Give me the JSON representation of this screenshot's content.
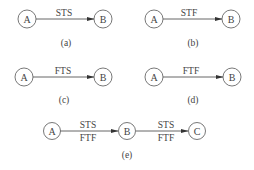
{
  "panels": [
    {
      "id": "a",
      "caption": "(a)",
      "from": "A",
      "to": "B",
      "labels": [
        "STS"
      ]
    },
    {
      "id": "b",
      "caption": "(b)",
      "from": "A",
      "to": "B",
      "labels": [
        "STF"
      ]
    },
    {
      "id": "c",
      "caption": "(c)",
      "from": "A",
      "to": "B",
      "labels": [
        "FTS"
      ]
    },
    {
      "id": "d",
      "caption": "(d)",
      "from": "A",
      "to": "B",
      "labels": [
        "FTF"
      ]
    },
    {
      "id": "e",
      "caption": "(e)",
      "nodes": [
        "A",
        "B",
        "C"
      ],
      "edges": [
        {
          "from": "A",
          "to": "B",
          "labels": [
            "STS",
            "FTF"
          ]
        },
        {
          "from": "B",
          "to": "C",
          "labels": [
            "STS",
            "FTF"
          ]
        }
      ]
    }
  ],
  "colors": {
    "stroke": "#555555",
    "text": "#444444",
    "background": "#ffffff"
  }
}
